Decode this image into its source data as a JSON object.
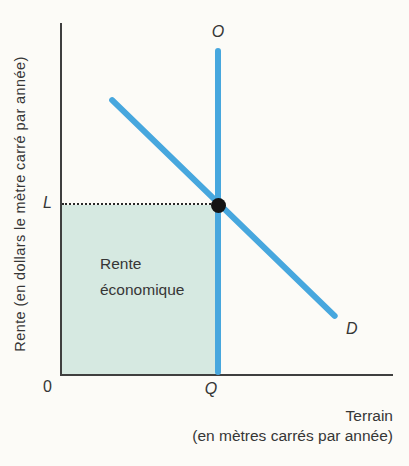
{
  "figure": {
    "y_axis_label": "Rente (en dollars le mètre carré par année)",
    "x_axis_label_line1": "Terrain",
    "x_axis_label_line2": "(en mètres carrés par année)",
    "origin_label": "0",
    "supply_label": "O",
    "demand_label": "D",
    "price_label": "L",
    "quantity_label": "Q",
    "area_label_line1": "Rente",
    "area_label_line2": "économique",
    "colors": {
      "curve_blue": "#47a7de",
      "area_green": "#d6e9e1",
      "axis": "#3f3f3f",
      "text": "#363636",
      "dot": "#141414",
      "dotted_guide": "#2a2a2a",
      "background": "#fcfbf7"
    }
  },
  "chart_data": {
    "type": "line",
    "title": "",
    "xlabel": "Terrain (en mètres carrés par année)",
    "ylabel": "Rente (en dollars le mètre carré par année)",
    "axis_ranges": {
      "x": [
        0,
        1
      ],
      "y": [
        0,
        1
      ],
      "note": "axes qualitatifs sans graduations numériques"
    },
    "grid": false,
    "legend": false,
    "series": [
      {
        "name": "O",
        "type": "vertical-supply",
        "color": "#47a7de",
        "points": [
          [
            0.473,
            0.0
          ],
          [
            0.473,
            0.93
          ]
        ]
      },
      {
        "name": "D",
        "type": "demand",
        "color": "#47a7de",
        "points": [
          [
            0.148,
            0.787
          ],
          [
            0.831,
            0.162
          ]
        ]
      }
    ],
    "equilibrium": {
      "x": 0.473,
      "y": 0.483,
      "x_label": "Q",
      "y_label": "L",
      "marker": "filled-dot"
    },
    "shaded_region": {
      "label": "Rente économique",
      "x_range": [
        0,
        0.473
      ],
      "y_range": [
        0,
        0.483
      ],
      "color": "#d6e9e1"
    },
    "guide_line": {
      "style": "dotted",
      "from": [
        0,
        0.483
      ],
      "to": [
        0.473,
        0.483
      ]
    }
  }
}
